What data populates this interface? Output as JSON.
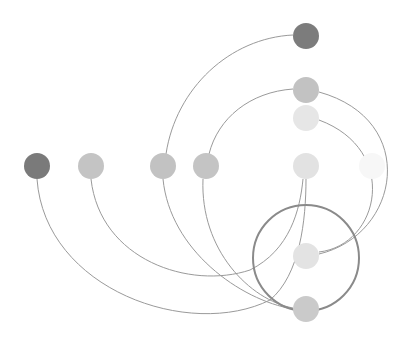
{
  "diagram": {
    "type": "arc-network",
    "ring": {
      "cx": 306,
      "cy": 258,
      "r": 53,
      "color": "#8a8a8a"
    },
    "nodes": [
      {
        "id": "n1",
        "cx": 37,
        "cy": 166,
        "r": 13,
        "color": "#7a7a7a"
      },
      {
        "id": "n2",
        "cx": 91,
        "cy": 166,
        "r": 13,
        "color": "#c4c4c4"
      },
      {
        "id": "n3",
        "cx": 163,
        "cy": 166,
        "r": 13,
        "color": "#c2c2c2"
      },
      {
        "id": "n4",
        "cx": 206,
        "cy": 166,
        "r": 13,
        "color": "#c4c4c4"
      },
      {
        "id": "n5",
        "cx": 306,
        "cy": 166,
        "r": 13,
        "color": "#e2e2e2"
      },
      {
        "id": "n6",
        "cx": 372,
        "cy": 166,
        "r": 13,
        "color": "#f7f7f7"
      },
      {
        "id": "top1",
        "cx": 306,
        "cy": 36,
        "r": 13,
        "color": "#7c7c7c"
      },
      {
        "id": "top2",
        "cx": 306,
        "cy": 90,
        "r": 13,
        "color": "#c2c2c2"
      },
      {
        "id": "top3",
        "cx": 306,
        "cy": 118,
        "r": 13,
        "color": "#e6e6e6"
      },
      {
        "id": "bot1",
        "cx": 306,
        "cy": 256,
        "r": 13,
        "color": "#e3e3e3"
      },
      {
        "id": "bot2",
        "cx": 306,
        "cy": 309,
        "r": 13,
        "color": "#cacaca"
      }
    ],
    "edges": [
      {
        "from": "n3",
        "to": "top1",
        "d": "M166,154 C176,88 230,38 293,35"
      },
      {
        "from": "n4",
        "to": "top2",
        "d": "M209,154 C218,118 250,92 293,89"
      },
      {
        "from": "top2",
        "to": "bot1",
        "d": "M319,92 C420,120 400,235 319,254"
      },
      {
        "from": "top3",
        "to": "bot1",
        "d": "M319,120 C400,150 380,245 319,252"
      },
      {
        "from": "n1",
        "to": "n5",
        "d": "M37,179 C45,290 190,340 270,300 C300,275 306,220 306,179"
      },
      {
        "from": "n2",
        "to": "n5",
        "d": "M91,179 C100,260 190,290 250,270 C290,250 300,210 303,179"
      },
      {
        "from": "n3",
        "to": "bot2",
        "d": "M163,179 C170,250 240,300 293,309"
      },
      {
        "from": "n4",
        "to": "bot2",
        "d": "M203,179 C200,250 250,300 293,308"
      }
    ]
  }
}
